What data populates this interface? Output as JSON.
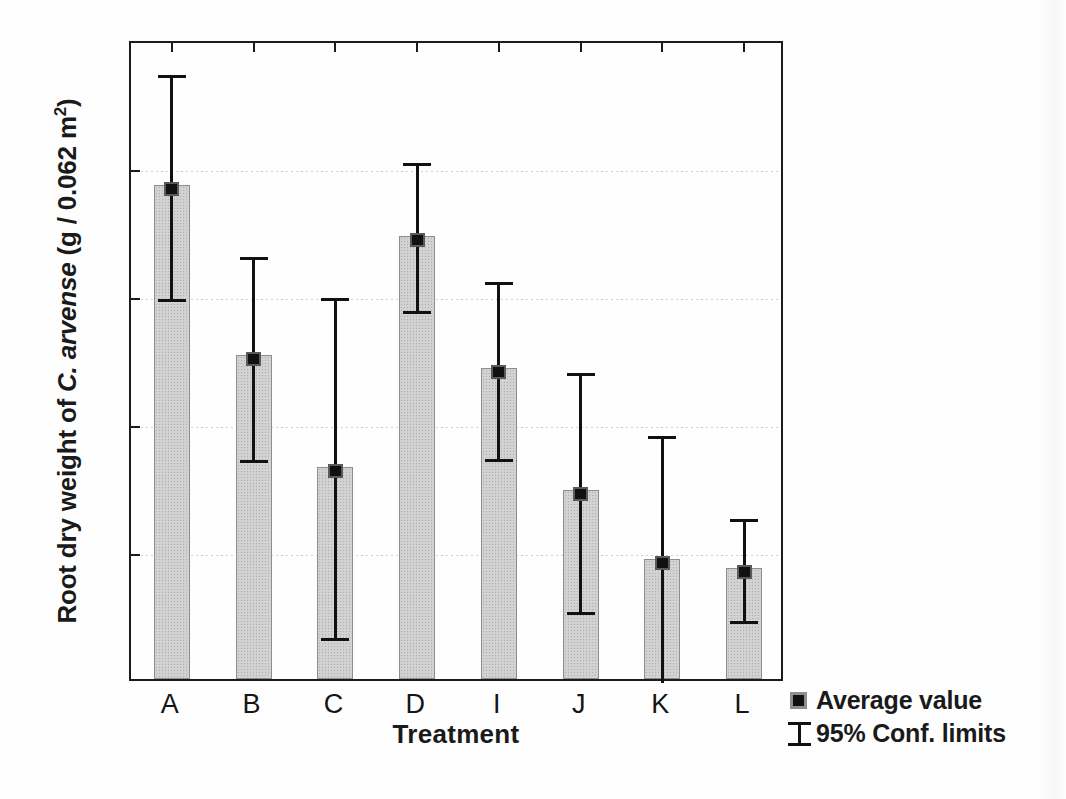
{
  "chart_data": {
    "type": "bar",
    "title": "",
    "xlabel": "Treatment",
    "ylabel_parts": {
      "pre": "Root dry weight of ",
      "italic": "C. arvense",
      "post_before_sup": " (g / 0.062 m",
      "sup": "2",
      "post_after_sup": ")"
    },
    "ylabel": "Root dry weight of C. arvense (g / 0.062 m2)",
    "categories": [
      "A",
      "B",
      "C",
      "D",
      "I",
      "J",
      "K",
      "L"
    ],
    "values": [
      38.6,
      25.3,
      16.6,
      34.6,
      24.3,
      14.8,
      9.4,
      8.7
    ],
    "ci_lower": [
      29.8,
      17.2,
      3.3,
      28.8,
      17.3,
      5.3,
      -6.5,
      4.6
    ],
    "ci_upper": [
      47.5,
      33.3,
      30.1,
      40.6,
      31.3,
      24.2,
      19.3,
      12.8
    ],
    "ci_lower_clipped": [
      false,
      false,
      false,
      false,
      false,
      false,
      true,
      false
    ],
    "ylim": [
      0,
      50
    ],
    "ytick_values": [
      0,
      10,
      20,
      30,
      40,
      50
    ],
    "ytick_labels": [
      "0",
      "10",
      "20",
      "30",
      "40",
      "50"
    ],
    "grid": true,
    "grid_style": "dotted-faint",
    "legend_position": "outside-bottom-right",
    "series_name": "Average value",
    "error_name": "95% Conf. limits",
    "colors": {
      "bar_fill": "#d2d2d2",
      "bar_edge": "#8d8d8d",
      "marker": "#111111",
      "error_bar": "#111111",
      "axis": "#1b1b1b",
      "text": "#151515",
      "background": "#fefefe"
    }
  },
  "legend": {
    "items": [
      {
        "label": "Average value",
        "icon": "filled-square-marker-icon"
      },
      {
        "label": "95% Conf. limits",
        "icon": "i-beam-error-bar-icon"
      }
    ]
  }
}
